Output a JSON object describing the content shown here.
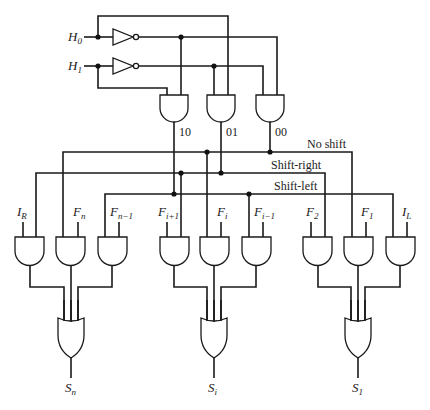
{
  "diagram": {
    "type": "logic-circuit",
    "inputs": [
      {
        "id": "H0",
        "base": "H",
        "sub": "0"
      },
      {
        "id": "H1",
        "base": "H",
        "sub": "1"
      }
    ],
    "decoder_outputs": [
      {
        "id": "g10",
        "label": "10"
      },
      {
        "id": "g01",
        "label": "01"
      },
      {
        "id": "g00",
        "label": "00"
      }
    ],
    "control_lines": [
      {
        "id": "no-shift",
        "label": "No shift"
      },
      {
        "id": "shift-right",
        "label": "Shift-right"
      },
      {
        "id": "shift-left",
        "label": "Shift-left"
      }
    ],
    "and_inputs": [
      {
        "base": "I",
        "sub": "R"
      },
      {
        "base": "F",
        "sub": "n"
      },
      {
        "base": "F",
        "sub": "n−1"
      },
      {
        "base": "F",
        "sub": "i+1"
      },
      {
        "base": "F",
        "sub": "i"
      },
      {
        "base": "F",
        "sub": "i−1"
      },
      {
        "base": "F",
        "sub": "2"
      },
      {
        "base": "F",
        "sub": "1"
      },
      {
        "base": "I",
        "sub": "L"
      }
    ],
    "outputs": [
      {
        "base": "S",
        "sub": "n"
      },
      {
        "base": "S",
        "sub": "i"
      },
      {
        "base": "S",
        "sub": "1"
      }
    ]
  }
}
